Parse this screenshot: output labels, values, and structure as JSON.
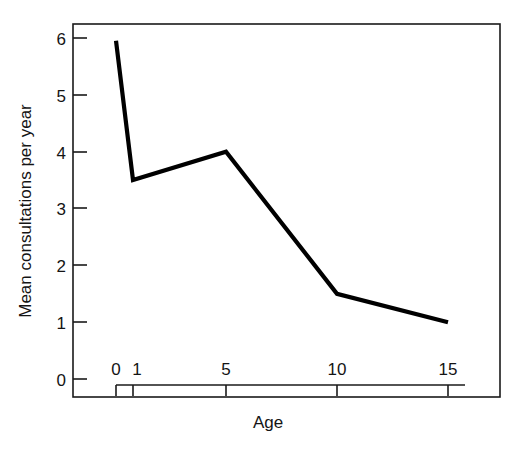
{
  "chart_data": {
    "type": "line",
    "title": "",
    "xlabel": "Age",
    "ylabel": "Mean consultations per year",
    "x": [
      0,
      1,
      5,
      10,
      15
    ],
    "values": [
      5.95,
      3.5,
      4.0,
      1.5,
      1.0
    ],
    "series": [
      {
        "name": "Mean consultations per year",
        "values": [
          5.95,
          3.5,
          4.0,
          1.5,
          1.0
        ]
      }
    ],
    "xlim": [
      0,
      15
    ],
    "ylim": [
      0,
      6
    ],
    "x_tick_labels": [
      "0",
      "1",
      "5",
      "10",
      "15"
    ],
    "y_tick_labels": [
      "0",
      "1",
      "2",
      "3",
      "4",
      "5",
      "6"
    ],
    "grid": false,
    "legend": false,
    "line_color": "#000000",
    "frame_color": "#1a1a1a",
    "background": "#ffffff"
  },
  "axes": {
    "y_title": "Mean consultations per year",
    "x_title": "Age",
    "y_ticks": [
      {
        "label": "6"
      },
      {
        "label": "5"
      },
      {
        "label": "4"
      },
      {
        "label": "3"
      },
      {
        "label": "2"
      },
      {
        "label": "1"
      },
      {
        "label": "0"
      }
    ],
    "x_ticks": [
      {
        "label": "0"
      },
      {
        "label": "1"
      },
      {
        "label": "5"
      },
      {
        "label": "10"
      },
      {
        "label": "15"
      }
    ]
  }
}
